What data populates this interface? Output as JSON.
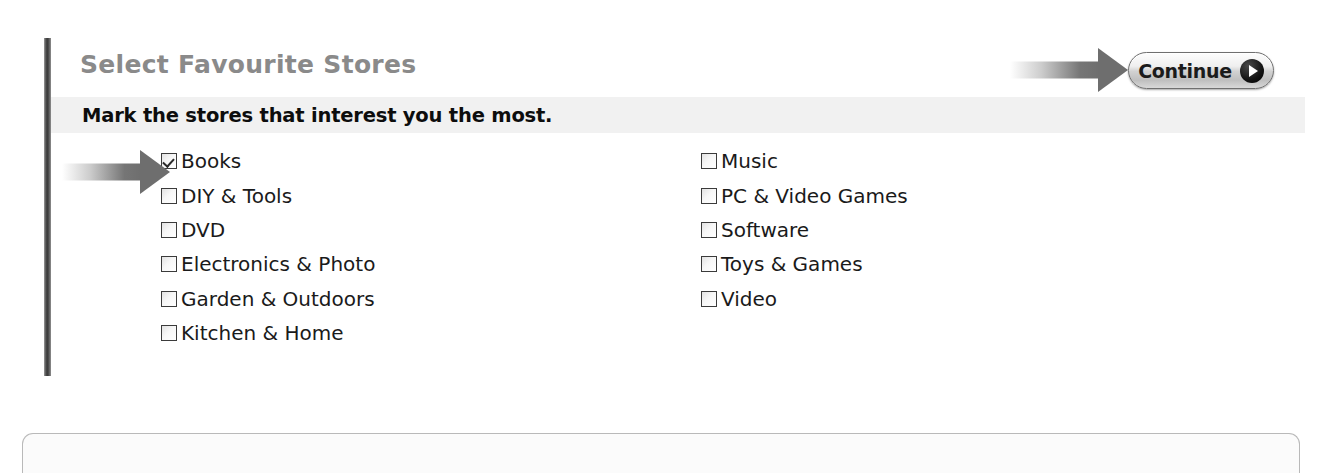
{
  "header": {
    "title": "Select Favourite Stores",
    "subtitle": "Mark the stores that interest you the most."
  },
  "continue_button": {
    "label": "Continue",
    "icon": "play-circle-icon"
  },
  "annotations": [
    {
      "name": "arrow-to-books-checkbox",
      "icon": "arrow-right-icon",
      "target": "Books"
    },
    {
      "name": "arrow-to-continue-button",
      "icon": "arrow-right-icon",
      "target": "Continue"
    }
  ],
  "store_columns": [
    {
      "name": "left",
      "items": [
        {
          "label": "Books",
          "checked": true
        },
        {
          "label": "DIY & Tools",
          "checked": false
        },
        {
          "label": "DVD",
          "checked": false
        },
        {
          "label": "Electronics & Photo",
          "checked": false
        },
        {
          "label": "Garden & Outdoors",
          "checked": false
        },
        {
          "label": "Kitchen & Home",
          "checked": false
        }
      ]
    },
    {
      "name": "right",
      "items": [
        {
          "label": "Music",
          "checked": false
        },
        {
          "label": "PC & Video Games",
          "checked": false
        },
        {
          "label": "Software",
          "checked": false
        },
        {
          "label": "Toys & Games",
          "checked": false
        },
        {
          "label": "Video",
          "checked": false
        }
      ]
    }
  ],
  "colors": {
    "title": "#8a8a8a",
    "subtitle_band": "#f1f1f1",
    "text": "#1a1a1a",
    "annotation_arrow": "#6e6e6e",
    "rule": "#3a3a3a",
    "box_border": "#b9b9b9"
  }
}
